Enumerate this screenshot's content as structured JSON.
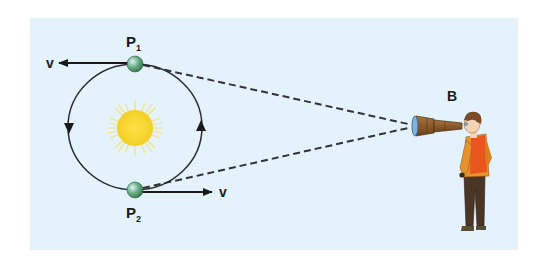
{
  "figure": {
    "type": "diagram",
    "background_color": "#e4f3fb",
    "labels": {
      "p1_main": "P",
      "p1_sub": "1",
      "p2_main": "P",
      "p2_sub": "2",
      "velocity_top": "v",
      "velocity_bottom": "v",
      "observer": "B"
    },
    "colors": {
      "orbit": "#2b2b2b",
      "sun": "#f5d830",
      "sun_rays": "#f7e27a",
      "planet": "#4a9a5e",
      "dashed_lines": "#333333",
      "telescope": "#8a5a2b",
      "lens": "#7fb4e0",
      "shirt": "#e8922e",
      "vest": "#e8561e",
      "trousers": "#4a3526",
      "hair": "#7a4a2a",
      "skin": "#f3d2b8"
    }
  }
}
